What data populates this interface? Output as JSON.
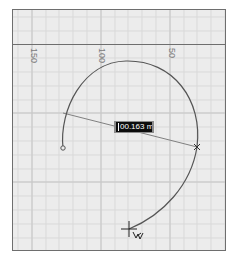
{
  "ruler": {
    "ticks": [
      {
        "label": "150",
        "x": 18
      },
      {
        "label": "100",
        "x": 86
      },
      {
        "label": "50",
        "x": 156
      }
    ]
  },
  "dimension": {
    "value": "100.163 mm",
    "display": "00.163 mm"
  },
  "colors": {
    "canvas_bg": "#ececec",
    "grid_minor": "#d9d9d9",
    "grid_major": "#c6c6c6",
    "frame": "#6e6e6e",
    "arc": "#555555",
    "leader": "#808080",
    "label_bg": "#0d0d0d",
    "label_border": "#8c8c8c"
  },
  "cursor": {
    "icon": "crosshair-pen-cursor"
  }
}
